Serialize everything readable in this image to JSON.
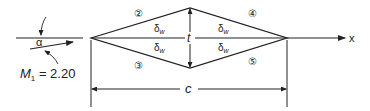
{
  "diagram": {
    "type": "diamond-airfoil-supersonic-flow",
    "labels": {
      "angle": "α",
      "mach": "M",
      "mach_sub": "1",
      "mach_value": " = 2.20",
      "region_2": "②",
      "region_3": "③",
      "region_4": "④",
      "region_5": "⑤",
      "wedge_angle": "δ",
      "wedge_sub": "w",
      "thickness": "t",
      "chord": "c",
      "x_axis": "x"
    },
    "colors": {
      "line": "#222222",
      "background": "#ffffff"
    }
  }
}
